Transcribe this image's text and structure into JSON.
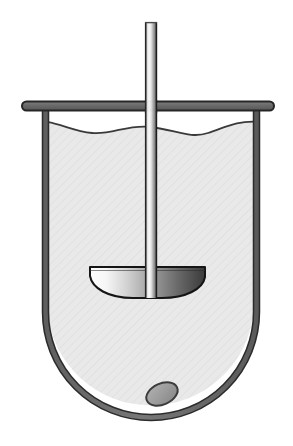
{
  "figure": {
    "title": "Stirred vessel with impeller",
    "background_color": "#ffffff",
    "canvas": {
      "width": 293,
      "height": 446
    }
  },
  "parts": [
    {
      "id": "vessel-wall",
      "label": "Vessel wall",
      "color": "#6e6e6e",
      "outline_color": "#2b2b2b",
      "stroke_width": 5
    },
    {
      "id": "vessel-rim",
      "label": "Vessel rim / flange",
      "color": "#6e6e6e",
      "outline_color": "#2b2b2b",
      "stroke_width": 8
    },
    {
      "id": "liquid",
      "label": "Liquid contents",
      "color": "#e9e9e9",
      "surface_color": "#3a3a3a"
    },
    {
      "id": "stirrer-shaft",
      "label": "Stirrer shaft",
      "color": "#f2f2f2",
      "shadow_color": "#5a5a5a",
      "outline_color": "#2b2b2b"
    },
    {
      "id": "impeller-blade",
      "label": "Impeller blade",
      "highlight_color": "#ffffff",
      "shadow_color": "#3c3c3c",
      "outline_color": "#151515"
    },
    {
      "id": "settled-particle",
      "label": "Settled particle",
      "color": "#9a9a9a",
      "outline_color": "#3a3a3a"
    }
  ],
  "geometry": {
    "rim": {
      "x1": 22,
      "x2": 274,
      "y": 106,
      "thickness": 9
    },
    "wall": {
      "left_x": 45,
      "right_x": 256,
      "top_y": 108,
      "bottom_y": 419,
      "corner_radius": 106
    },
    "liquid_level_y": 122,
    "shaft": {
      "center_x": 151,
      "half_width": 6,
      "top_y": 22,
      "bottom_y": 297
    },
    "blade": {
      "left_x": 90,
      "right_x": 205,
      "top_y": 267,
      "bottom_y": 298
    },
    "particle": {
      "cx": 162,
      "cy": 394,
      "rx": 16,
      "ry": 10,
      "rotation_deg": -24
    }
  }
}
